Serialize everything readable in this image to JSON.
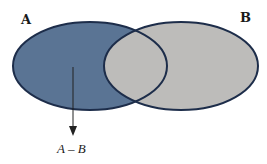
{
  "diagram": {
    "type": "venn",
    "sets": [
      {
        "label": "A",
        "fill": "#5a7494",
        "stroke": "#1d2d4a"
      },
      {
        "label": "B",
        "fill": "#bdbcba",
        "stroke": "#1d2d4a"
      }
    ],
    "intersection_fill": "#bdbcba",
    "highlighted_region": "A - B",
    "annotation": {
      "text": "A – B",
      "arrow": "down"
    }
  }
}
